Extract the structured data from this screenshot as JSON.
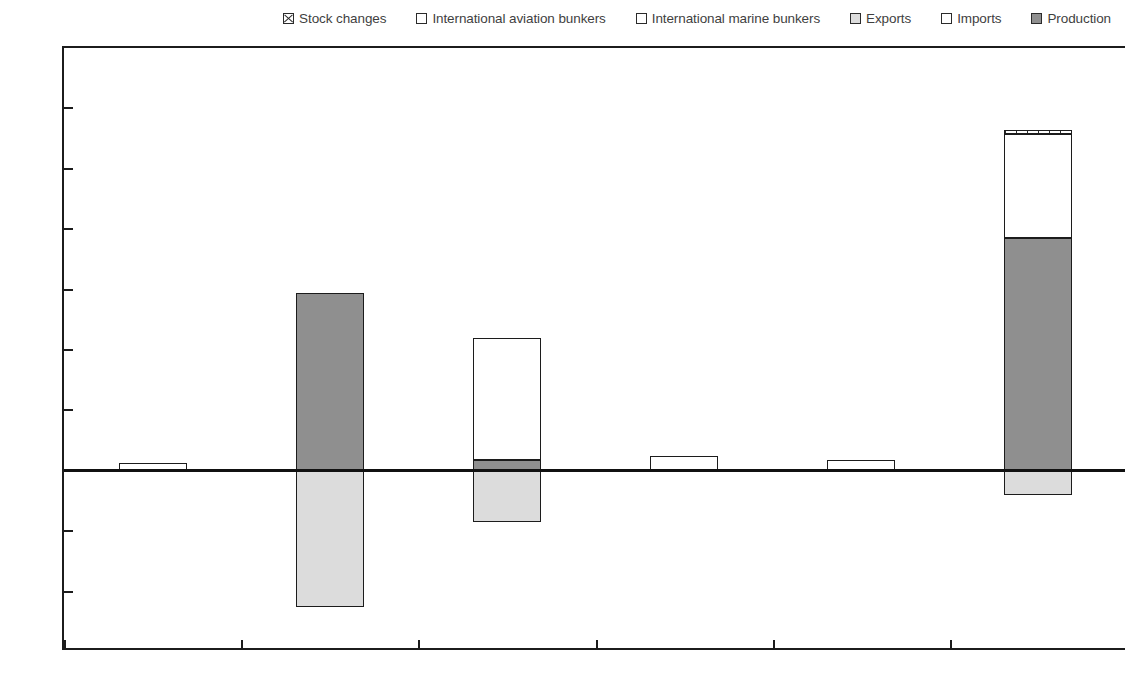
{
  "legend": {
    "position": "top",
    "items": [
      {
        "label": "Stock changes",
        "key": "stock",
        "swatch": "hatched-cross"
      },
      {
        "label": "International aviation bunkers",
        "key": "avbunkers",
        "swatch": "white"
      },
      {
        "label": "International marine bunkers",
        "key": "marbunkers",
        "swatch": "white"
      },
      {
        "label": "Exports",
        "key": "exports",
        "swatch": "light-gray"
      },
      {
        "label": "Imports",
        "key": "imports",
        "swatch": "white"
      },
      {
        "label": "Production",
        "key": "production",
        "swatch": "medium-gray"
      }
    ]
  },
  "axis": {
    "y_ticks": [
      140,
      120,
      100,
      80,
      60,
      40,
      20,
      0,
      -20,
      -40,
      -60
    ],
    "y_min": -60,
    "y_max": 140,
    "y_step": 20
  },
  "colors": {
    "production": "#8f8f8f",
    "exports": "#dcdcdc",
    "imports": "#ffffff",
    "stock_changes": "#ffffff",
    "axis": "#1c1c1c",
    "tick_text": "#555555"
  },
  "chart_data": {
    "type": "bar",
    "title": "",
    "subtitle": "",
    "xlabel": "",
    "ylabel": "",
    "ylim": [
      -60,
      140
    ],
    "grid": false,
    "stacked": true,
    "legend_position": "top",
    "categories": [
      "Armenia",
      "Azerbaijan",
      "Belarus",
      "Georgia",
      "Moldova",
      "Ukraine"
    ],
    "series": [
      {
        "name": "Stock changes",
        "values": [
          0,
          0,
          0,
          0,
          0,
          1.5
        ]
      },
      {
        "name": "International aviation bunkers",
        "values": [
          0,
          0,
          0,
          0,
          0,
          0
        ]
      },
      {
        "name": "International marine bunkers",
        "values": [
          0,
          0,
          0,
          0,
          0,
          0
        ]
      },
      {
        "name": "Exports",
        "values": [
          0,
          -45,
          -17,
          0,
          0,
          -8
        ]
      },
      {
        "name": "Imports",
        "values": [
          2.5,
          0,
          40.5,
          5,
          3.5,
          34.5
        ]
      },
      {
        "name": "Production",
        "values": [
          0,
          59,
          3.5,
          0,
          0,
          77
        ]
      }
    ]
  },
  "bars": [
    {
      "category": "Armenia",
      "segments": [
        {
          "key": "imports",
          "name": "Imports",
          "from": 0,
          "to": 2.5
        }
      ]
    },
    {
      "category": "Azerbaijan",
      "segments": [
        {
          "key": "production",
          "name": "Production",
          "from": 0,
          "to": 59
        },
        {
          "key": "exports",
          "name": "Exports",
          "from": 0,
          "to": -45
        }
      ]
    },
    {
      "category": "Belarus",
      "segments": [
        {
          "key": "production",
          "name": "Production",
          "from": 0,
          "to": 3.5
        },
        {
          "key": "imports",
          "name": "Imports",
          "from": 3.5,
          "to": 44
        },
        {
          "key": "exports",
          "name": "Exports",
          "from": 0,
          "to": -17
        }
      ]
    },
    {
      "category": "Georgia",
      "segments": [
        {
          "key": "imports",
          "name": "Imports",
          "from": 0,
          "to": 5
        }
      ]
    },
    {
      "category": "Moldova",
      "segments": [
        {
          "key": "imports",
          "name": "Imports",
          "from": 0,
          "to": 3.5
        }
      ]
    },
    {
      "category": "Ukraine",
      "segments": [
        {
          "key": "production",
          "name": "Production",
          "from": 0,
          "to": 77
        },
        {
          "key": "imports",
          "name": "Imports",
          "from": 77,
          "to": 111.5
        },
        {
          "key": "stock",
          "name": "Stock changes",
          "from": 111.5,
          "to": 113
        },
        {
          "key": "exports",
          "name": "Exports",
          "from": 0,
          "to": -8
        }
      ]
    }
  ]
}
